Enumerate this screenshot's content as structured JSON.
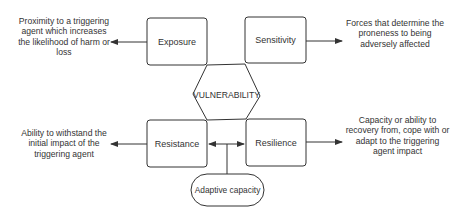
{
  "diagram": {
    "center": {
      "label": "VULNERABILITY"
    },
    "nodes": {
      "exposure": {
        "label": "Exposure",
        "description": "Proximity to a triggering agent which increases the likelihood of harm or loss"
      },
      "sensitivity": {
        "label": "Sensitivity",
        "description": "Forces that determine the proneness to being adversely affected"
      },
      "resistance": {
        "label": "Resistance",
        "description": "Ability to withstand the initial impact of the triggering agent"
      },
      "resilience": {
        "label": "Resilience",
        "description": "Capacity or ability to recovery from, cope with or adapt to the triggering agent impact"
      },
      "adaptive_capacity": {
        "label": "Adaptive capacity"
      }
    },
    "colors": {
      "stroke": "#333333",
      "text": "#333333",
      "background": "#ffffff"
    }
  }
}
